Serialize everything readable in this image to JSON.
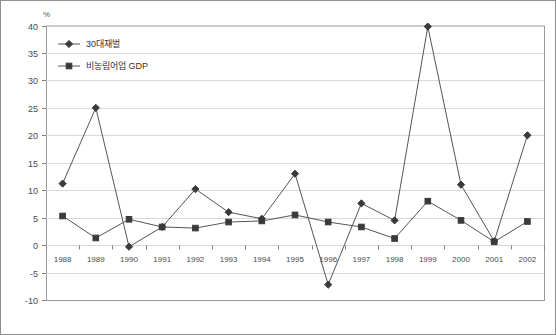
{
  "chart_data": {
    "type": "line",
    "title": "",
    "unit_label": "%",
    "xlabel": "",
    "ylabel": "",
    "ylim": [
      -10,
      40
    ],
    "ytick_step": 5,
    "yticks": [
      40,
      35,
      30,
      25,
      20,
      15,
      10,
      5,
      0,
      -5,
      -10
    ],
    "grid": true,
    "legend_position": "top-left",
    "categories": [
      "1988",
      "1989",
      "1990",
      "1991",
      "1992",
      "1993",
      "1994",
      "1995",
      "1996",
      "1997",
      "1998",
      "1999",
      "2000",
      "2001",
      "2002"
    ],
    "series": [
      {
        "name": "30대재벌",
        "marker": "diamond",
        "color": "#3a3a3a",
        "values": [
          11.2,
          25.0,
          -0.3,
          3.3,
          10.2,
          6.0,
          4.8,
          13.0,
          -7.2,
          7.6,
          4.5,
          39.8,
          11.0,
          0.7,
          20.0
        ]
      },
      {
        "name": "비농림어업 GDP",
        "marker": "square",
        "color": "#3a3a3a",
        "values": [
          5.3,
          1.3,
          4.7,
          3.3,
          3.1,
          4.2,
          4.4,
          5.5,
          4.2,
          3.3,
          1.2,
          8.0,
          4.5,
          0.6,
          4.3
        ]
      }
    ]
  },
  "colors": {
    "line": "#555555",
    "marker": "#3a3a3a",
    "grid": "#d9d9d9",
    "axis": "#808080",
    "frame": "#9a9a9a",
    "text": "#4a4a4a"
  }
}
